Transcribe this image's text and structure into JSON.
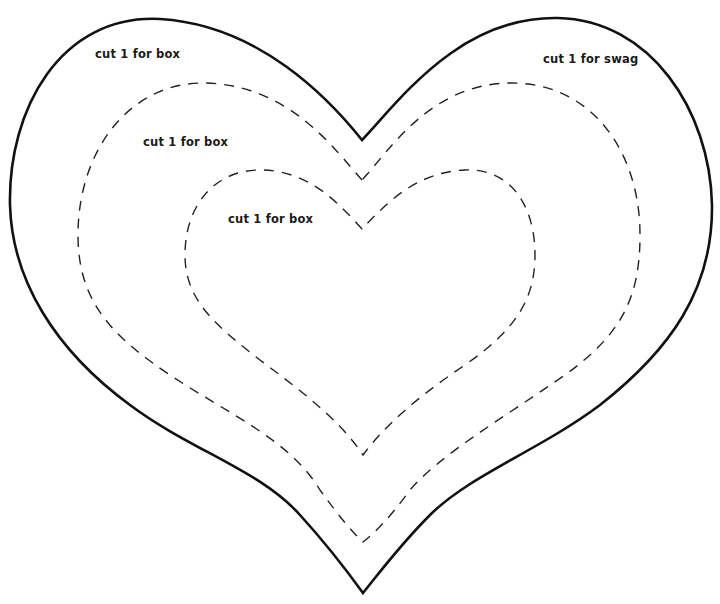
{
  "template": {
    "type": "heart-cutout-template",
    "background_color": "#ffffff",
    "stroke_color": "#111111",
    "shapes": [
      {
        "name": "outer-heart",
        "line_style": "solid",
        "labels": [
          "cut 1 for box",
          "cut 1 for swag"
        ]
      },
      {
        "name": "middle-heart",
        "line_style": "dashed",
        "labels": [
          "cut 1 for box"
        ]
      },
      {
        "name": "inner-heart",
        "line_style": "dashed",
        "labels": [
          "cut 1 for box"
        ]
      }
    ]
  },
  "labels": {
    "outer_box": "cut 1 for box",
    "outer_swag": "cut 1 for swag",
    "middle_box": "cut 1 for box",
    "inner_box": "cut 1 for box"
  }
}
